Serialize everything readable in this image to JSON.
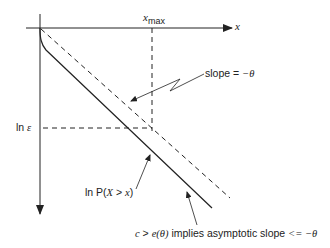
{
  "diagram": {
    "axes": {
      "x_axis_label": "x",
      "y_axis_direction": "downward"
    },
    "markers": {
      "x_max_label_var": "x",
      "x_max_label_sub": "max",
      "ln_epsilon_prefix": "ln ",
      "ln_epsilon_symbol": "ε"
    },
    "annotations": {
      "slope": {
        "prefix": "slope = ",
        "value": "−θ"
      },
      "ln_p": {
        "prefix": "ln P(",
        "var1": "X",
        "middle": " > ",
        "var2": "x",
        "suffix": ")"
      },
      "asymptotic": {
        "c": "c",
        "gt": " > ",
        "e": "e",
        "theta_paren": "(θ)",
        "text": " implies asymptotic slope ",
        "le": "<= −θ"
      }
    },
    "curves": [
      {
        "name": "reference-line",
        "style": "dashed",
        "description": "line with slope −θ"
      },
      {
        "name": "ln-tail-probability",
        "style": "solid",
        "description": "ln P(X > x)"
      }
    ],
    "colors": {
      "ink": "#222222",
      "background": "#ffffff"
    }
  }
}
